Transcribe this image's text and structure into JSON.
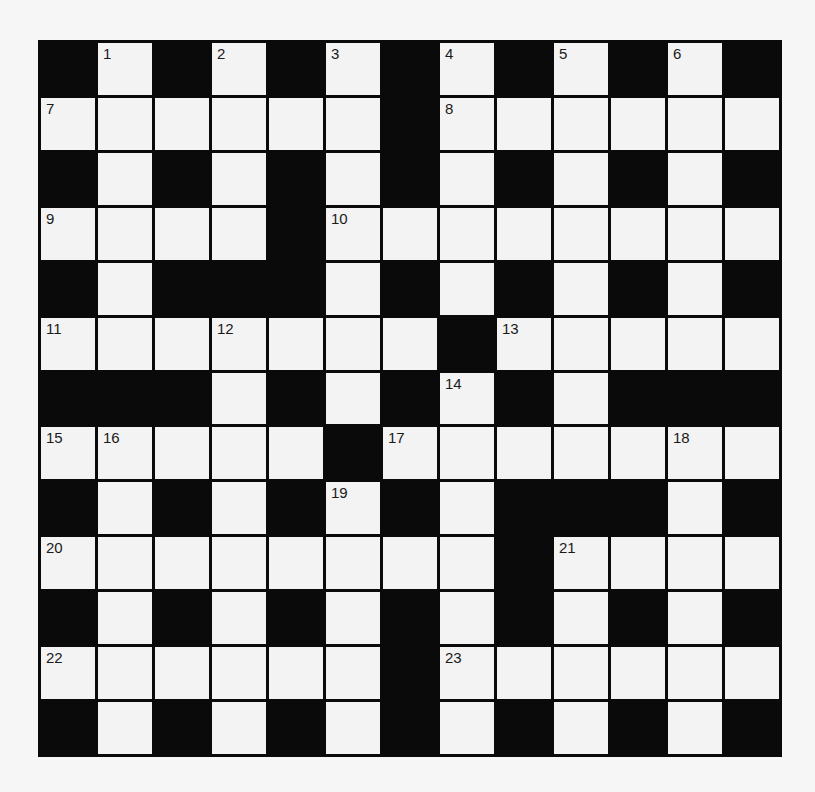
{
  "puzzle": {
    "rows": 13,
    "cols": 13,
    "grid": [
      "BWBWBWBWBWBWB",
      "WWWWWWBWWWWWW",
      "BWBWBWBWBWBWB",
      "WWWWBWWWWWWWW",
      "BWBBBWBWBWBWB",
      "WWWWWWWBWWWWW",
      "BBBWBWBWBWBBB",
      "WWWWWBWWWWWWW",
      "BWBWBWBWBBBWB",
      "WWWWWWWWBWWWW",
      "BWBWBWBWBWBWB",
      "WWWWWWBWWWWWW",
      "BWBWBWBWBWBWB"
    ],
    "numbers": [
      {
        "n": "1",
        "r": 0,
        "c": 1
      },
      {
        "n": "2",
        "r": 0,
        "c": 3
      },
      {
        "n": "3",
        "r": 0,
        "c": 5
      },
      {
        "n": "4",
        "r": 0,
        "c": 7
      },
      {
        "n": "5",
        "r": 0,
        "c": 9
      },
      {
        "n": "6",
        "r": 0,
        "c": 11
      },
      {
        "n": "7",
        "r": 1,
        "c": 0
      },
      {
        "n": "8",
        "r": 1,
        "c": 7
      },
      {
        "n": "9",
        "r": 3,
        "c": 0
      },
      {
        "n": "10",
        "r": 3,
        "c": 5
      },
      {
        "n": "11",
        "r": 5,
        "c": 0
      },
      {
        "n": "12",
        "r": 5,
        "c": 3
      },
      {
        "n": "13",
        "r": 5,
        "c": 8
      },
      {
        "n": "14",
        "r": 6,
        "c": 7
      },
      {
        "n": "15",
        "r": 7,
        "c": 0
      },
      {
        "n": "16",
        "r": 7,
        "c": 1
      },
      {
        "n": "17",
        "r": 7,
        "c": 6
      },
      {
        "n": "18",
        "r": 7,
        "c": 11
      },
      {
        "n": "19",
        "r": 8,
        "c": 5
      },
      {
        "n": "20",
        "r": 9,
        "c": 0
      },
      {
        "n": "21",
        "r": 9,
        "c": 9
      },
      {
        "n": "22",
        "r": 11,
        "c": 0
      },
      {
        "n": "23",
        "r": 11,
        "c": 7
      }
    ]
  },
  "colors": {
    "block": "#0a0a0a",
    "cell": "#f3f3f3",
    "background": "#f6f6f6",
    "number": "#1a1a1a"
  }
}
